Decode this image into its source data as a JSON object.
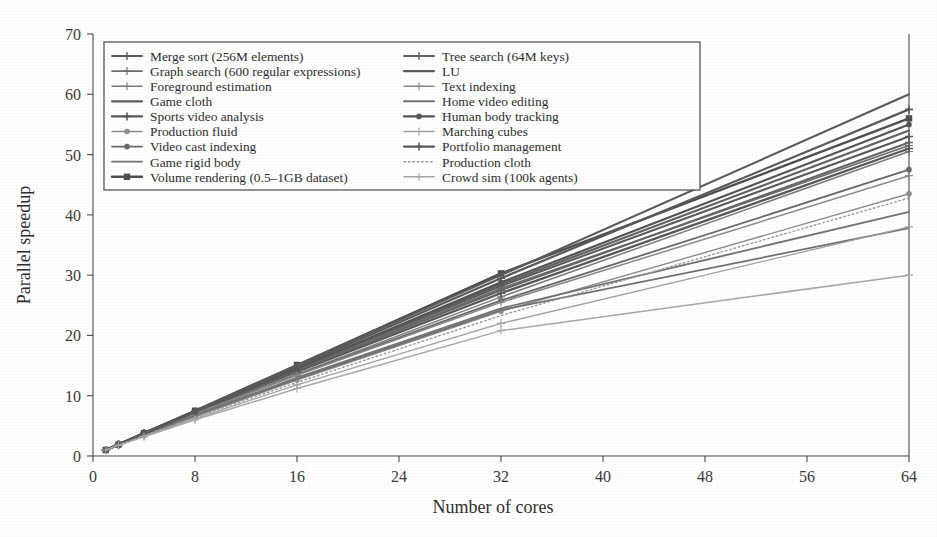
{
  "chart_data": {
    "type": "line",
    "title": "",
    "xlabel": "Number of cores",
    "ylabel": "Parallel speedup",
    "xlim": [
      0,
      64
    ],
    "ylim": [
      0,
      70
    ],
    "xticks": [
      0,
      8,
      16,
      24,
      32,
      40,
      48,
      56,
      64
    ],
    "yticks": [
      0,
      10,
      20,
      30,
      40,
      50,
      60,
      70
    ],
    "grid": false,
    "legend_position": "upper-left-inside",
    "legend_columns": 2,
    "x": [
      1,
      2,
      4,
      8,
      16,
      32,
      64
    ],
    "series": [
      {
        "name": "Merge sort (256M elements)",
        "values": [
          1,
          1.9,
          3.7,
          7.3,
          14.4,
          28.2,
          53.0
        ],
        "color": "#5a5a5a",
        "marker": "plus",
        "width": 2.0,
        "dash": "none"
      },
      {
        "name": "Graph search (600 regular expressions)",
        "values": [
          1,
          1.9,
          3.7,
          7.3,
          14.3,
          27.8,
          51.5
        ],
        "color": "#6e6e6e",
        "marker": "plus",
        "width": 1.7,
        "dash": "none"
      },
      {
        "name": "Foreground estimation",
        "values": [
          1,
          1.9,
          3.6,
          7.0,
          13.6,
          26.4,
          50.5
        ],
        "color": "#7d7d7d",
        "marker": "plus",
        "width": 1.5,
        "dash": "none"
      },
      {
        "name": "Game cloth",
        "values": [
          1,
          1.9,
          3.8,
          7.4,
          14.6,
          28.5,
          54.0
        ],
        "color": "#626262",
        "marker": "none",
        "width": 2.2,
        "dash": "none"
      },
      {
        "name": "Sports video analysis",
        "values": [
          1,
          1.9,
          3.7,
          7.2,
          14.0,
          27.0,
          51.0
        ],
        "color": "#585858",
        "marker": "plus",
        "width": 2.3,
        "dash": "none"
      },
      {
        "name": "Production fluid",
        "values": [
          1,
          1.8,
          3.4,
          6.5,
          12.6,
          24.0,
          43.5
        ],
        "color": "#8d8d8d",
        "marker": "dot",
        "width": 1.4,
        "dash": "none"
      },
      {
        "name": "Video cast indexing",
        "values": [
          1,
          1.9,
          3.6,
          7.0,
          13.5,
          25.8,
          47.5
        ],
        "color": "#6a6a6a",
        "marker": "dot",
        "width": 1.8,
        "dash": "none"
      },
      {
        "name": "Game rigid body",
        "values": [
          1,
          1.8,
          3.5,
          6.7,
          12.8,
          24.2,
          37.8
        ],
        "color": "#707070",
        "marker": "none",
        "width": 1.7,
        "dash": "none"
      },
      {
        "name": "Volume rendering (0.5–1GB dataset)",
        "values": [
          1,
          1.9,
          3.8,
          7.5,
          15.1,
          30.3,
          56.0
        ],
        "color": "#4f4f4f",
        "marker": "square",
        "width": 2.4,
        "dash": "none"
      },
      {
        "name": "Tree search (64M keys)",
        "values": [
          1,
          1.9,
          3.7,
          7.2,
          14.2,
          27.5,
          52.0
        ],
        "color": "#656565",
        "marker": "plus",
        "width": 2.0,
        "dash": "none"
      },
      {
        "name": "LU",
        "values": [
          1,
          1.9,
          3.8,
          7.5,
          15.0,
          30.0,
          60.0
        ],
        "color": "#5c5c5c",
        "marker": "none",
        "width": 2.1,
        "dash": "none"
      },
      {
        "name": "Text indexing",
        "values": [
          1,
          1.9,
          3.6,
          7.0,
          13.4,
          25.5,
          46.5
        ],
        "color": "#8a8a8a",
        "marker": "plus",
        "width": 1.5,
        "dash": "none"
      },
      {
        "name": "Home video editing",
        "values": [
          1,
          1.8,
          3.5,
          6.8,
          13.0,
          24.5,
          40.5
        ],
        "color": "#747474",
        "marker": "none",
        "width": 1.9,
        "dash": "none"
      },
      {
        "name": "Human body tracking",
        "values": [
          1,
          1.9,
          3.7,
          7.3,
          14.5,
          28.8,
          55.0
        ],
        "color": "#555555",
        "marker": "dot",
        "width": 2.2,
        "dash": "none"
      },
      {
        "name": "Marching cubes",
        "values": [
          1,
          1.8,
          3.3,
          6.2,
          11.8,
          22.0,
          38.0
        ],
        "color": "#a2a2a2",
        "marker": "plus",
        "width": 1.3,
        "dash": "none"
      },
      {
        "name": "Portfolio management",
        "values": [
          1,
          1.9,
          3.8,
          7.4,
          14.8,
          29.5,
          57.5
        ],
        "color": "#595959",
        "marker": "plus",
        "width": 2.2,
        "dash": "none"
      },
      {
        "name": "Production cloth",
        "values": [
          1,
          1.8,
          3.4,
          6.4,
          12.2,
          23.3,
          42.8
        ],
        "color": "#9b9b9b",
        "marker": "none",
        "width": 1.4,
        "dash": "dotted"
      },
      {
        "name": "Crowd sim (100k agents)",
        "values": [
          1,
          1.8,
          3.2,
          6.0,
          11.2,
          20.8,
          30.0
        ],
        "color": "#a8a8a8",
        "marker": "plus",
        "width": 1.5,
        "dash": "none"
      }
    ]
  },
  "legend": {
    "columns": [
      [
        "Merge sort (256M elements)",
        "Graph search (600 regular expressions)",
        "Foreground estimation",
        "Game cloth",
        "Sports video analysis",
        "Production fluid",
        "Video cast indexing",
        "Game rigid body",
        "Volume rendering (0.5–1GB dataset)"
      ],
      [
        "Tree search (64M keys)",
        "LU",
        "Text indexing",
        "Home video editing",
        "Human body tracking",
        "Marching cubes",
        "Portfolio management",
        "Production cloth",
        "Crowd sim (100k agents)"
      ]
    ]
  },
  "colors": {
    "axis": "#4a4a4a",
    "text": "#2e2e2e",
    "background": "#ffffff"
  }
}
